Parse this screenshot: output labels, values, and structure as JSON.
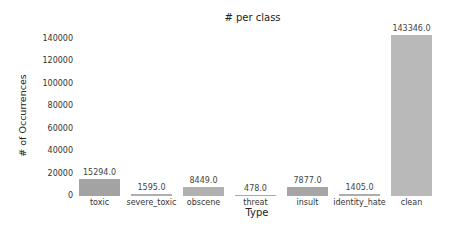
{
  "chart_data": {
    "type": "bar",
    "title": "# per class",
    "xlabel": "Type",
    "ylabel": "# of Occurrences",
    "categories": [
      "toxic",
      "severe_toxic",
      "obscene",
      "threat",
      "insult",
      "identity_hate",
      "clean"
    ],
    "values": [
      15294.0,
      1595.0,
      8449.0,
      478.0,
      7877.0,
      1405.0,
      143346.0
    ],
    "value_labels": [
      "15294.0",
      "1595.0",
      "8449.0",
      "478.0",
      "7877.0",
      "1405.0",
      "143346.0"
    ],
    "colors": [
      "#a3a3a3",
      "#aeaeae",
      "#b0b0b0",
      "#aaaaaa",
      "#a6a6a6",
      "#adadad",
      "#b9b9b9"
    ],
    "yticks": [
      "0",
      "20000",
      "40000",
      "60000",
      "80000",
      "100000",
      "120000",
      "140000"
    ],
    "ylim": [
      0,
      145000
    ],
    "grid": false,
    "legend": null
  }
}
